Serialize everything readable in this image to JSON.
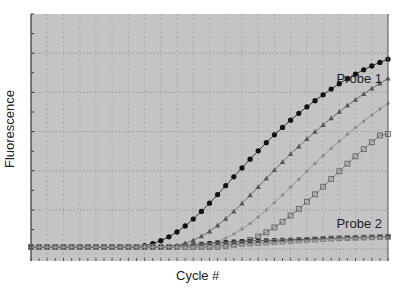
{
  "chart_data": {
    "type": "line",
    "title": "",
    "xlabel": "Cycle #",
    "ylabel": "Fluorescence",
    "xlim": [
      1,
      45
    ],
    "ylim": [
      0,
      100
    ],
    "grid": true,
    "legend_position": "inline annotations",
    "annotations": [
      {
        "text": "Probe 1",
        "near": "top-right curves"
      },
      {
        "text": "Probe 2",
        "near": "bottom-right curves"
      }
    ],
    "x": [
      1,
      2,
      3,
      4,
      5,
      6,
      7,
      8,
      9,
      10,
      11,
      12,
      13,
      14,
      15,
      16,
      17,
      18,
      19,
      20,
      21,
      22,
      23,
      24,
      25,
      26,
      27,
      28,
      29,
      30,
      31,
      32,
      33,
      34,
      35,
      36,
      37,
      38,
      39,
      40,
      41,
      42,
      43,
      44,
      45
    ],
    "series": [
      {
        "name": "Probe 1 - sample A",
        "group": "Probe 1",
        "marker": "filled-circle",
        "color": "#111111",
        "values": [
          5.7,
          5.7,
          5.7,
          5.7,
          5.7,
          5.7,
          5.7,
          5.7,
          5.7,
          5.7,
          5.7,
          5.7,
          5.7,
          5.7,
          6.2,
          7.0,
          8.2,
          9.8,
          11.8,
          14.2,
          17.0,
          20.1,
          23.4,
          26.9,
          30.5,
          34.1,
          37.7,
          41.2,
          44.6,
          47.9,
          51.1,
          54.1,
          57.0,
          59.8,
          62.4,
          64.9,
          67.3,
          69.6,
          71.8,
          73.8,
          75.7,
          77.4,
          79.0,
          80.4,
          81.7
        ]
      },
      {
        "name": "Probe 1 - sample B",
        "group": "Probe 1",
        "marker": "filled-triangle",
        "color": "#555555",
        "values": [
          5.7,
          5.7,
          5.7,
          5.7,
          5.7,
          5.7,
          5.7,
          5.7,
          5.7,
          5.7,
          5.7,
          5.7,
          5.7,
          5.7,
          5.7,
          5.7,
          5.7,
          5.9,
          6.4,
          7.2,
          8.4,
          10.0,
          12.0,
          14.4,
          17.1,
          20.1,
          23.3,
          26.6,
          30.0,
          33.4,
          36.8,
          40.1,
          43.3,
          46.4,
          49.4,
          52.3,
          55.1,
          57.8,
          60.4,
          62.9,
          65.3,
          67.6,
          69.8,
          71.9,
          73.9
        ]
      },
      {
        "name": "Probe 1 - sample C",
        "group": "Probe 1",
        "marker": "small-diamond",
        "color": "#8a8a8a",
        "values": [
          5.7,
          5.7,
          5.7,
          5.7,
          5.7,
          5.7,
          5.7,
          5.7,
          5.7,
          5.7,
          5.7,
          5.7,
          5.7,
          5.7,
          5.7,
          5.7,
          5.7,
          5.7,
          5.7,
          5.7,
          5.8,
          6.2,
          6.9,
          7.9,
          9.2,
          10.9,
          12.9,
          15.2,
          17.8,
          20.6,
          23.6,
          26.7,
          29.9,
          33.1,
          36.3,
          39.5,
          42.6,
          45.6,
          48.5,
          51.3,
          54.0,
          56.6,
          59.1,
          61.5,
          63.8
        ]
      },
      {
        "name": "Probe 1 - sample D",
        "group": "Probe 1",
        "marker": "open-square",
        "color": "#666666",
        "values": [
          5.7,
          5.7,
          5.7,
          5.7,
          5.7,
          5.7,
          5.7,
          5.7,
          5.7,
          5.7,
          5.7,
          5.7,
          5.7,
          5.7,
          5.7,
          5.7,
          5.7,
          5.7,
          5.7,
          5.7,
          5.7,
          5.7,
          5.7,
          5.8,
          6.1,
          6.6,
          7.4,
          8.5,
          9.9,
          11.6,
          13.6,
          15.9,
          18.4,
          21.1,
          24.0,
          27.0,
          30.1,
          33.2,
          36.3,
          39.4,
          42.4,
          45.3,
          48.1,
          50.8,
          51.4
        ]
      },
      {
        "name": "Probe 2 - sample A",
        "group": "Probe 2",
        "marker": "filled-square",
        "color": "#333333",
        "values": [
          5.7,
          5.7,
          5.7,
          5.7,
          5.7,
          5.7,
          5.7,
          5.7,
          5.7,
          5.7,
          5.7,
          5.7,
          5.7,
          5.7,
          5.7,
          5.7,
          5.7,
          5.8,
          6.0,
          6.3,
          6.6,
          6.9,
          7.2,
          7.4,
          7.6,
          7.8,
          8.0,
          8.1,
          8.2,
          8.3,
          8.4,
          8.5,
          8.6,
          8.7,
          8.8,
          8.9,
          9.0,
          9.1,
          9.2,
          9.3,
          9.4,
          9.5,
          9.6,
          9.7,
          9.8
        ]
      },
      {
        "name": "Probe 2 - sample B",
        "group": "Probe 2",
        "marker": "open-square",
        "color": "#777777",
        "values": [
          5.7,
          5.7,
          5.7,
          5.7,
          5.7,
          5.7,
          5.7,
          5.7,
          5.7,
          5.7,
          5.7,
          5.7,
          5.7,
          5.7,
          5.7,
          5.7,
          5.7,
          5.7,
          5.7,
          5.7,
          5.8,
          5.9,
          6.1,
          6.3,
          6.5,
          6.7,
          6.9,
          7.1,
          7.3,
          7.5,
          7.7,
          7.9,
          8.1,
          8.3,
          8.5,
          8.7,
          8.9,
          9.1,
          9.2,
          9.3,
          9.4,
          9.5,
          9.6,
          9.7,
          9.8
        ]
      },
      {
        "name": "Probe 2 - sample C",
        "group": "Probe 2",
        "marker": "small-diamond",
        "color": "#9a9a9a",
        "values": [
          5.7,
          5.7,
          5.7,
          5.7,
          5.7,
          5.7,
          5.7,
          5.7,
          5.7,
          5.7,
          5.7,
          5.7,
          5.7,
          5.7,
          5.7,
          5.7,
          5.7,
          5.7,
          5.7,
          5.7,
          5.7,
          5.7,
          5.8,
          5.9,
          6.0,
          6.2,
          6.4,
          6.6,
          6.8,
          7.0,
          7.2,
          7.4,
          7.6,
          7.8,
          8.0,
          8.2,
          8.4,
          8.6,
          8.8,
          9.0,
          9.1,
          9.2,
          9.3,
          9.4,
          9.5
        ]
      }
    ]
  },
  "labels": {
    "xlabel": "Cycle #",
    "ylabel": "Fluorescence",
    "probe1": "Probe 1",
    "probe2": "Probe 2"
  },
  "colors": {
    "plot_background": "#c4c4c4",
    "grid": "#9a9a9a",
    "axis": "#555555"
  }
}
